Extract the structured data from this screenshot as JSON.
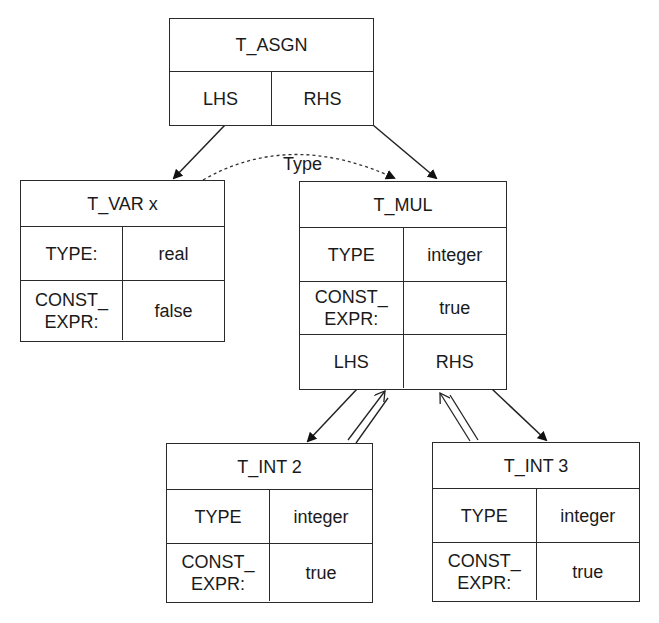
{
  "diagram": {
    "type": "attributed-syntax-tree",
    "edge_label": "Type",
    "nodes": {
      "asgn": {
        "title": "T_ASGN",
        "fields": [
          {
            "left": "LHS",
            "right": "RHS"
          }
        ]
      },
      "var": {
        "title": "T_VAR x",
        "fields": [
          {
            "left": "TYPE:",
            "right": "real"
          },
          {
            "left": "CONST_\nEXPR:",
            "right": "false"
          }
        ]
      },
      "mul": {
        "title": "T_MUL",
        "fields": [
          {
            "left": "TYPE",
            "right": "integer"
          },
          {
            "left": "CONST_\nEXPR:",
            "right": "true"
          },
          {
            "left": "LHS",
            "right": "RHS"
          }
        ]
      },
      "int2": {
        "title": "T_INT 2",
        "fields": [
          {
            "left": "TYPE",
            "right": "integer"
          },
          {
            "left": "CONST_\nEXPR:",
            "right": "true"
          }
        ]
      },
      "int3": {
        "title": "T_INT 3",
        "fields": [
          {
            "left": "TYPE",
            "right": "integer"
          },
          {
            "left": "CONST_\nEXPR:",
            "right": "true"
          }
        ]
      }
    },
    "edges": [
      {
        "from": "T_ASGN.LHS",
        "to": "T_VAR x",
        "style": "solid-arrow"
      },
      {
        "from": "T_ASGN.RHS",
        "to": "T_MUL",
        "style": "solid-arrow"
      },
      {
        "from": "T_VAR x",
        "to": "T_MUL",
        "style": "dotted-arrow",
        "label": "Type"
      },
      {
        "from": "T_MUL.LHS",
        "to": "T_INT 2",
        "style": "solid-arrow"
      },
      {
        "from": "T_INT 2",
        "to": "T_MUL.LHS",
        "style": "double-open-arrow"
      },
      {
        "from": "T_MUL.RHS",
        "to": "T_INT 3",
        "style": "solid-arrow"
      },
      {
        "from": "T_INT 3",
        "to": "T_MUL.RHS",
        "style": "double-open-arrow"
      }
    ]
  }
}
